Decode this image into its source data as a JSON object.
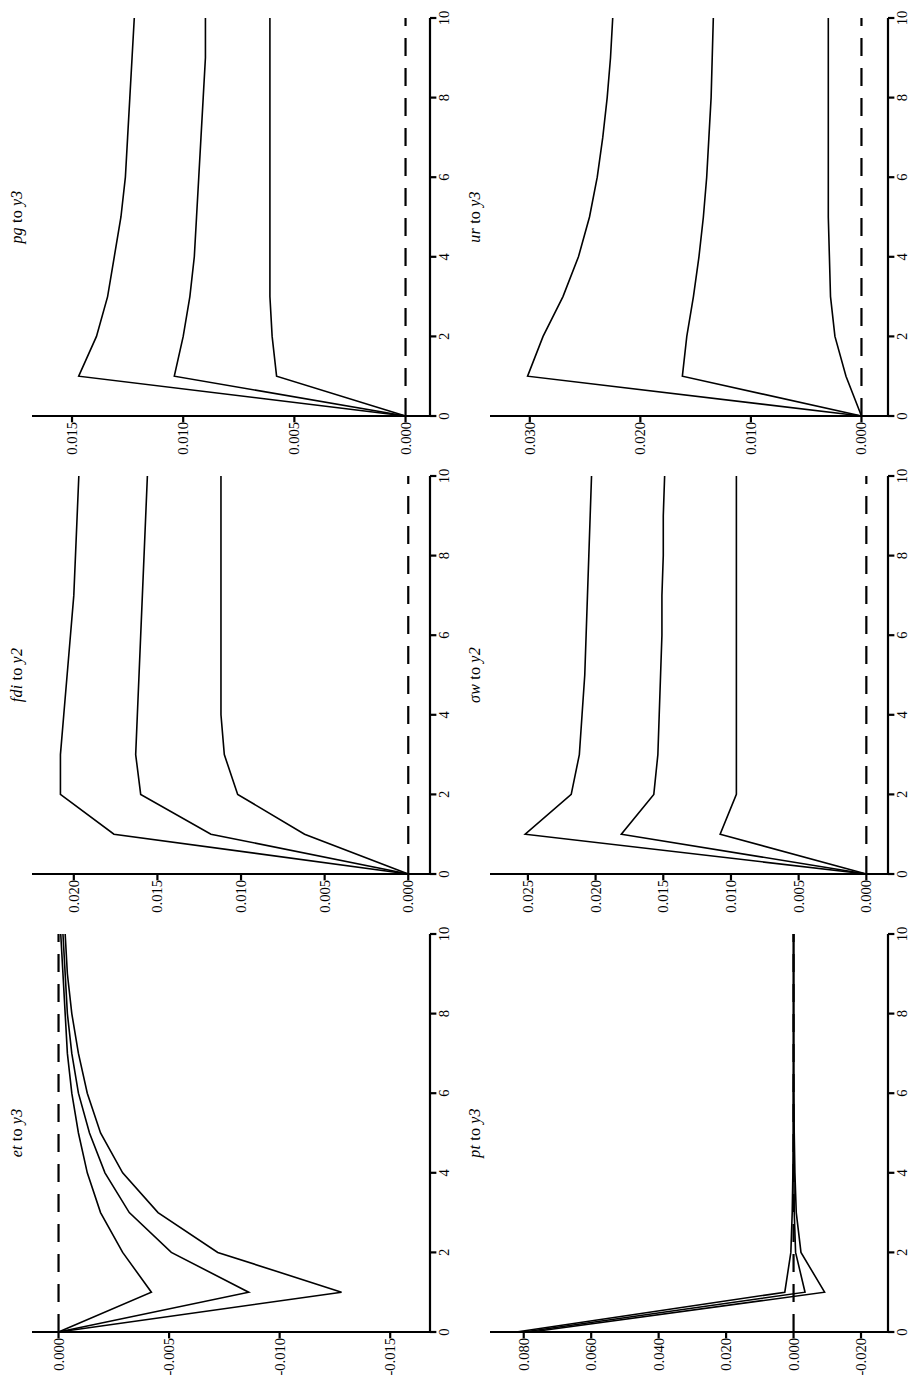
{
  "figure": {
    "type": "impulse-response-panel-grid",
    "rows": 2,
    "cols": 3,
    "orientation": "rotated-90-ccw",
    "line_color": "#000000",
    "zero_line_style": "dashed",
    "background": "#ffffff"
  },
  "chart_data": [
    {
      "type": "line",
      "panel_index": 0,
      "title": "et to y3",
      "impulse": "et",
      "response": "y3",
      "xlabel": "",
      "ylabel": "",
      "x": [
        0,
        1,
        2,
        3,
        4,
        5,
        6,
        7,
        8,
        9,
        10
      ],
      "xlim": [
        0,
        10
      ],
      "xticks": [
        0,
        2,
        4,
        6,
        8,
        10
      ],
      "xtick_labels": [
        "0",
        "2",
        "4",
        "6",
        "8",
        "10"
      ],
      "ylim": [
        -0.0168,
        0.0012
      ],
      "yticks": [
        0.0,
        -0.005,
        -0.01,
        -0.015
      ],
      "ytick_labels": [
        "0.000",
        "-0.005",
        "-0.010",
        "-0.015"
      ],
      "grid": false,
      "legend": "none",
      "zero_line": 0.0,
      "series": [
        {
          "name": "upper-band",
          "values": [
            0.0,
            -0.0042,
            -0.0029,
            -0.0019,
            -0.0013,
            -0.0009,
            -0.0006,
            -0.0004,
            -0.0003,
            -0.0002,
            -0.0001
          ]
        },
        {
          "name": "median",
          "values": [
            0.0,
            -0.0086,
            -0.0051,
            -0.0032,
            -0.0021,
            -0.0014,
            -0.0009,
            -0.0006,
            -0.0004,
            -0.0003,
            -0.0002
          ]
        },
        {
          "name": "lower-band",
          "values": [
            0.0,
            -0.0128,
            -0.0072,
            -0.0045,
            -0.0029,
            -0.0019,
            -0.0013,
            -0.0009,
            -0.0006,
            -0.0004,
            -0.0003
          ]
        }
      ]
    },
    {
      "type": "line",
      "panel_index": 1,
      "title": "fdi to y2",
      "impulse": "fdi",
      "response": "y2",
      "xlabel": "",
      "ylabel": "",
      "x": [
        0,
        1,
        2,
        3,
        4,
        5,
        6,
        7,
        8,
        9,
        10
      ],
      "xlim": [
        0,
        10
      ],
      "xticks": [
        0,
        2,
        4,
        6,
        8,
        10
      ],
      "xtick_labels": [
        "0",
        "2",
        "4",
        "6",
        "8",
        "10"
      ],
      "ylim": [
        -0.0013,
        0.0225
      ],
      "yticks": [
        0.02,
        0.015,
        0.01,
        0.005,
        0.0
      ],
      "ytick_labels": [
        "0.020",
        "0.015",
        "0.010",
        "0.005",
        "0.000"
      ],
      "grid": false,
      "legend": "none",
      "zero_line": 0.0,
      "series": [
        {
          "name": "upper-band",
          "values": [
            0.0,
            0.0176,
            0.0208,
            0.0208,
            0.0206,
            0.0204,
            0.0202,
            0.02,
            0.0199,
            0.0198,
            0.0197
          ]
        },
        {
          "name": "median",
          "values": [
            0.0,
            0.0118,
            0.016,
            0.0163,
            0.0162,
            0.0161,
            0.016,
            0.0159,
            0.0158,
            0.0157,
            0.0156
          ]
        },
        {
          "name": "lower-band",
          "values": [
            0.0,
            0.0062,
            0.0102,
            0.011,
            0.0112,
            0.0112,
            0.0112,
            0.0112,
            0.0112,
            0.0112,
            0.0112
          ]
        }
      ]
    },
    {
      "type": "line",
      "panel_index": 2,
      "title": "pg to y3",
      "impulse": "pg",
      "response": "y3",
      "xlabel": "",
      "ylabel": "",
      "x": [
        0,
        1,
        2,
        3,
        4,
        5,
        6,
        7,
        8,
        9,
        10
      ],
      "xlim": [
        0,
        10
      ],
      "xticks": [
        0,
        2,
        4,
        6,
        8,
        10
      ],
      "xtick_labels": [
        "0",
        "2",
        "4",
        "6",
        "8",
        "10"
      ],
      "ylim": [
        -0.0011,
        0.0168
      ],
      "yticks": [
        0.015,
        0.01,
        0.005,
        0.0
      ],
      "ytick_labels": [
        "0.015",
        "0.010",
        "0.005",
        "0.000"
      ],
      "grid": false,
      "legend": "none",
      "zero_line": 0.0,
      "series": [
        {
          "name": "upper-band",
          "values": [
            0.0,
            0.0147,
            0.0139,
            0.0134,
            0.0131,
            0.0128,
            0.0126,
            0.0125,
            0.0124,
            0.0123,
            0.0122
          ]
        },
        {
          "name": "median",
          "values": [
            0.0,
            0.0104,
            0.01,
            0.0097,
            0.0095,
            0.0094,
            0.0093,
            0.0092,
            0.0091,
            0.009,
            0.009
          ]
        },
        {
          "name": "lower-band",
          "values": [
            0.0,
            0.0058,
            0.006,
            0.0061,
            0.0061,
            0.0061,
            0.0061,
            0.0061,
            0.0061,
            0.0061,
            0.0061
          ]
        }
      ]
    },
    {
      "type": "line",
      "panel_index": 3,
      "title": "pt to y3",
      "impulse": "pt",
      "response": "y3",
      "xlabel": "",
      "ylabel": "",
      "x": [
        0,
        1,
        2,
        3,
        4,
        5,
        6,
        7,
        8,
        9,
        10
      ],
      "xlim": [
        0,
        10
      ],
      "xticks": [
        0,
        2,
        4,
        6,
        8,
        10
      ],
      "xtick_labels": [
        "0",
        "2",
        "4",
        "6",
        "8",
        "10"
      ],
      "ylim": [
        -0.028,
        0.09
      ],
      "yticks": [
        0.08,
        0.06,
        0.04,
        0.02,
        0.0,
        -0.02
      ],
      "ytick_labels": [
        "0.080",
        "0.060",
        "0.040",
        "0.020",
        "0.000",
        "-0.020"
      ],
      "grid": false,
      "legend": "none",
      "zero_line": 0.0,
      "series": [
        {
          "name": "upper-band",
          "values": [
            0.0822,
            0.0026,
            0.0008,
            0.0004,
            0.0002,
            0.0001,
            0.0001,
            0.0,
            0.0,
            0.0,
            0.0
          ]
        },
        {
          "name": "median",
          "values": [
            0.08,
            -0.0034,
            -0.0006,
            -0.0002,
            -0.0001,
            0.0,
            0.0,
            0.0,
            0.0,
            0.0,
            0.0
          ]
        },
        {
          "name": "lower-band",
          "values": [
            0.0778,
            -0.0092,
            -0.0022,
            -0.0008,
            -0.0004,
            -0.0002,
            -0.0001,
            0.0,
            0.0,
            0.0,
            0.0
          ]
        }
      ]
    },
    {
      "type": "line",
      "panel_index": 4,
      "title": "σw to y2",
      "impulse": "σw",
      "response": "y2",
      "xlabel": "",
      "ylabel": "",
      "x": [
        0,
        1,
        2,
        3,
        4,
        5,
        6,
        7,
        8,
        9,
        10
      ],
      "xlim": [
        0,
        10
      ],
      "xticks": [
        0,
        2,
        4,
        6,
        8,
        10
      ],
      "xtick_labels": [
        "0",
        "2",
        "4",
        "6",
        "8",
        "10"
      ],
      "ylim": [
        -0.0016,
        0.0278
      ],
      "yticks": [
        0.025,
        0.02,
        0.015,
        0.01,
        0.005,
        0.0
      ],
      "ytick_labels": [
        "0.025",
        "0.020",
        "0.015",
        "0.010",
        "0.005",
        "0.000"
      ],
      "grid": false,
      "legend": "none",
      "zero_line": 0.0,
      "series": [
        {
          "name": "upper-band",
          "values": [
            0.0,
            0.0252,
            0.0218,
            0.0212,
            0.021,
            0.0208,
            0.0207,
            0.0206,
            0.0205,
            0.0204,
            0.0203
          ]
        },
        {
          "name": "median",
          "values": [
            0.0,
            0.0181,
            0.0157,
            0.0154,
            0.0153,
            0.0152,
            0.0151,
            0.0151,
            0.015,
            0.015,
            0.0149
          ]
        },
        {
          "name": "lower-band",
          "values": [
            0.0,
            0.0108,
            0.0096,
            0.0096,
            0.0096,
            0.0096,
            0.0096,
            0.0096,
            0.0096,
            0.0096,
            0.0096
          ]
        }
      ]
    },
    {
      "type": "line",
      "panel_index": 5,
      "title": "ur to y3",
      "impulse": "ur",
      "response": "y3",
      "xlabel": "",
      "ylabel": "",
      "x": [
        0,
        1,
        2,
        3,
        4,
        5,
        6,
        7,
        8,
        9,
        10
      ],
      "xlim": [
        0,
        10
      ],
      "xticks": [
        0,
        2,
        4,
        6,
        8,
        10
      ],
      "xtick_labels": [
        "0",
        "2",
        "4",
        "6",
        "8",
        "10"
      ],
      "ylim": [
        -0.0024,
        0.0336
      ],
      "yticks": [
        0.03,
        0.02,
        0.01,
        0.0
      ],
      "ytick_labels": [
        "0.030",
        "0.020",
        "0.010",
        "0.000"
      ],
      "grid": false,
      "legend": "none",
      "zero_line": 0.0,
      "series": [
        {
          "name": "upper-band",
          "values": [
            0.0,
            0.0302,
            0.0288,
            0.027,
            0.0256,
            0.0246,
            0.0239,
            0.0234,
            0.023,
            0.0227,
            0.0225
          ]
        },
        {
          "name": "median",
          "values": [
            0.0,
            0.0162,
            0.0158,
            0.0152,
            0.0147,
            0.0143,
            0.014,
            0.0138,
            0.0136,
            0.0135,
            0.0134
          ]
        },
        {
          "name": "lower-band",
          "values": [
            0.0,
            0.0014,
            0.0024,
            0.0028,
            0.0029,
            0.003,
            0.003,
            0.003,
            0.003,
            0.003,
            0.003
          ]
        }
      ]
    }
  ]
}
